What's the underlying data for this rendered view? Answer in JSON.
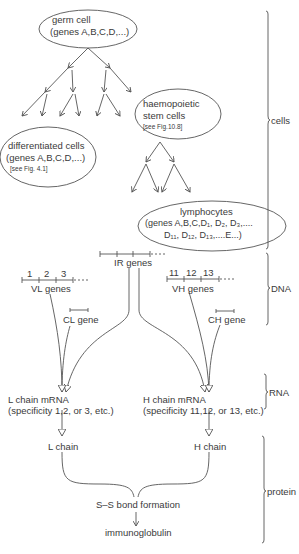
{
  "cells": {
    "germ_cell": {
      "title": "germ cell",
      "genes": "(genes A,B,C,D,...)"
    },
    "differentiated_cells": {
      "title": "differentiated cells",
      "genes": "(genes A,B,C,D,...)",
      "ref": "[see Fig. 4.1]"
    },
    "haemopoietic": {
      "title_line1": "haemopoietic",
      "title_line2": "stem cells",
      "ref": "[see Fig.10.8]"
    },
    "lymphocytes": {
      "title": "lymphocytes",
      "genes_line1": "(genes A,B,C,D₁, D₂, D₃,....",
      "genes_line2": "D₁₁, D₁₂, D₁₃,....E...)"
    }
  },
  "dna": {
    "vl": {
      "numbers": [
        "1",
        "2",
        "3"
      ],
      "label": "VL genes"
    },
    "ir": {
      "label": "IR genes"
    },
    "vh": {
      "numbers": [
        "11",
        "12",
        "13"
      ],
      "label": "VH genes"
    },
    "cl": {
      "label": "CL gene"
    },
    "ch": {
      "label": "CH gene"
    }
  },
  "rna": {
    "l_mrna": {
      "title": "L chain mRNA",
      "specificity": "(specificity 1,2, or 3, etc.)"
    },
    "h_mrna": {
      "title": "H chain mRNA",
      "specificity": "(specificity 11,12, or 13, etc.)"
    }
  },
  "protein": {
    "l_chain": "L chain",
    "h_chain": "H chain",
    "bond": "S–S bond formation",
    "product": "immunoglobulin"
  },
  "brackets": {
    "cells": "cells",
    "dna": "DNA",
    "rna": "RNA",
    "protein": "protein"
  },
  "colors": {
    "line": "#555555",
    "text": "#3a3a3a",
    "background": "#ffffff"
  }
}
